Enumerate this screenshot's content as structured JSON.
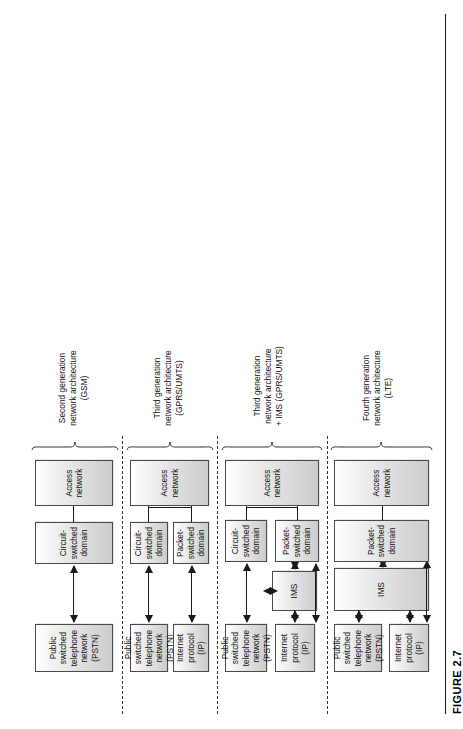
{
  "figure": {
    "caption": "FIGURE 2.7",
    "orientation": "rotated-90-ccw"
  },
  "labels": {
    "ip": "Internet protocol\n(IP)",
    "pstn_multiline": "Public switched\ntelephone network\n(PSTN)",
    "pstn_wide": "Public switched\ntelephone network (PSTN)",
    "ims": "IMS",
    "cs_domain": "Circuit-switched\ndomain",
    "ps_domain": "Packet-switched\ndomain",
    "ps_domain_wide": "Packet-switched domain",
    "access": "Access network"
  },
  "sections": [
    {
      "id": "gsm",
      "label": "Second generation\nnetwork architecture\n(GSM)",
      "boxes": [
        {
          "name": "pstn-box",
          "text": "Public switched\ntelephone network\n(PSTN)"
        },
        {
          "name": "cs-domain-box",
          "text": "Circuit-switched\ndomain"
        },
        {
          "name": "access-network-box",
          "text": "Access network"
        }
      ]
    },
    {
      "id": "umts",
      "label": "Third generation\nnetwork architecture\n(GPRS/UMTS)",
      "boxes": [
        {
          "name": "pstn-box",
          "text": "Public switched\ntelephone network\n(PSTN)"
        },
        {
          "name": "ip-box",
          "text": "Internet protocol\n(IP)"
        },
        {
          "name": "cs-domain-box",
          "text": "Circuit-switched\ndomain"
        },
        {
          "name": "ps-domain-box",
          "text": "Packet-switched\ndomain"
        },
        {
          "name": "access-network-box",
          "text": "Access network"
        }
      ]
    },
    {
      "id": "umts-ims",
      "label": "Third generation\nnetwork architecture\n+ IMS (GPRS/UMTS)",
      "boxes": [
        {
          "name": "pstn-box",
          "text": "Public switched\ntelephone network\n(PSTN)"
        },
        {
          "name": "ip-box",
          "text": "Internet protocol\n(IP)"
        },
        {
          "name": "ims-box",
          "text": "IMS"
        },
        {
          "name": "cs-domain-box",
          "text": "Circuit-switched\ndomain"
        },
        {
          "name": "ps-domain-box",
          "text": "Packet-switched\ndomain"
        },
        {
          "name": "access-network-box",
          "text": "Access network"
        }
      ]
    },
    {
      "id": "lte",
      "label": "Fourth generation\nnetwork architecture\n(LTE)",
      "boxes": [
        {
          "name": "pstn-box",
          "text": "Public switched\ntelephone network (PSTN)"
        },
        {
          "name": "ip-box",
          "text": "Internet protocol\n(IP)"
        },
        {
          "name": "ims-box",
          "text": "IMS"
        },
        {
          "name": "ps-domain-box",
          "text": "Packet-switched domain"
        },
        {
          "name": "access-network-box",
          "text": "Access network"
        }
      ]
    }
  ],
  "colors": {
    "box_stroke": "#4a4a4a",
    "box_fill_light": "#ffffff",
    "box_fill_dark": "#cccccc",
    "line": "#1a1a1a",
    "background": "#ffffff"
  }
}
